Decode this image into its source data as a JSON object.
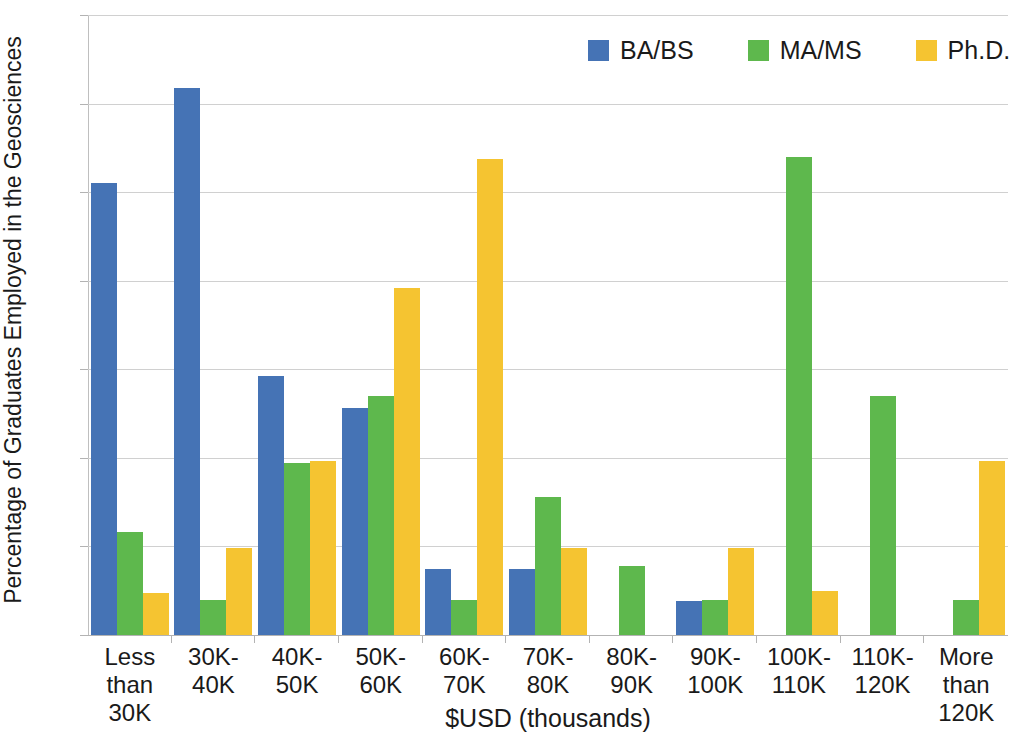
{
  "chart_data": {
    "type": "bar",
    "title": "",
    "xlabel": "$USD (thousands)",
    "ylabel": "Percentage of Graduates Employed in the Geosciences",
    "ylim": [
      0,
      35
    ],
    "ytick_labels": [
      "35%",
      "30%",
      "25%",
      "20%",
      "15%",
      "10%",
      "5%",
      "0%"
    ],
    "ytick_values": [
      35,
      30,
      25,
      20,
      15,
      10,
      5,
      0
    ],
    "grid": true,
    "legend_position": "top-right",
    "categories": [
      "Less than\n30K",
      "30K-\n40K",
      "40K-\n50K",
      "50K-\n60K",
      "60K-\n70K",
      "70K-\n80K",
      "80K-\n90K",
      "90K-\n100K",
      "100K-\n110K",
      "110K-\n120K",
      "More than\n120K"
    ],
    "series": [
      {
        "name": "BA/BS",
        "color": "#4573B5",
        "values": [
          25.5,
          30.9,
          14.6,
          12.8,
          3.7,
          3.7,
          0,
          1.9,
          0,
          0,
          0
        ]
      },
      {
        "name": "MA/MS",
        "color": "#5EB84D",
        "values": [
          5.8,
          2.0,
          9.7,
          13.5,
          2.0,
          7.8,
          3.9,
          2.0,
          27.0,
          13.5,
          2.0
        ]
      },
      {
        "name": "Ph.D.",
        "color": "#F5C431",
        "values": [
          2.4,
          4.9,
          9.8,
          19.6,
          26.9,
          4.9,
          0,
          4.9,
          2.5,
          0,
          9.8
        ]
      }
    ]
  }
}
